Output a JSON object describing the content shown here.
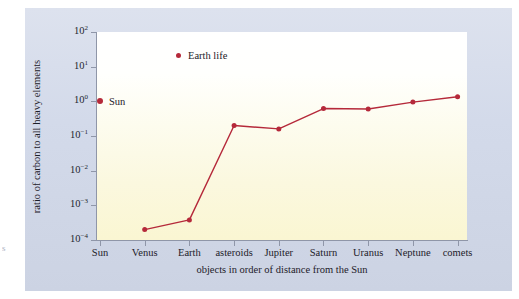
{
  "figure": {
    "margin_artifact": "s"
  },
  "chart_data": {
    "type": "line",
    "title": "",
    "subtitle": "",
    "xlabel": "objects in order of distance from the Sun",
    "ylabel": "ratio of carbon to all heavy elements",
    "yscale": "log",
    "ylim": [
      0.0001,
      100
    ],
    "grid": false,
    "legend_position": "top-center-inside",
    "categories": [
      "Sun",
      "Venus",
      "Earth",
      "asteroids",
      "Jupiter",
      "Saturn",
      "Uranus",
      "Neptune",
      "comets"
    ],
    "ytick_labels": [
      "10²",
      "10¹",
      "10⁰",
      "10⁻¹",
      "10⁻²",
      "10⁻³",
      "10⁻⁴"
    ],
    "ytick_bases": [
      "10",
      "10",
      "10",
      "10",
      "10",
      "10",
      "10"
    ],
    "ytick_exponents": [
      "2",
      "1",
      "0",
      "-1",
      "-2",
      "-3",
      "-4"
    ],
    "ytick_values": [
      100,
      10,
      1,
      0.1,
      0.01,
      0.001,
      0.0001
    ],
    "series": [
      {
        "name": "carbon to heavy element ratio",
        "color": "#b5293a",
        "x": [
          "Venus",
          "Earth",
          "asteroids",
          "Jupiter",
          "Saturn",
          "Uranus",
          "Neptune",
          "comets"
        ],
        "values": [
          0.0002,
          0.00038,
          0.2,
          0.16,
          0.62,
          0.6,
          0.95,
          1.35
        ]
      }
    ],
    "annotations": [
      {
        "name": "sun-marker",
        "label": "Sun",
        "x": "Sun",
        "value": 1.0,
        "color": "#b5293a"
      }
    ],
    "legend": [
      {
        "label": "Earth life",
        "color": "#b5293a",
        "marker": "dot"
      }
    ],
    "colors": {
      "series": "#b5293a",
      "panel": "#d3daea",
      "plot_top": "#ffffff",
      "plot_bottom": "#faf6d2",
      "axis": "#8f96a8",
      "text": "#1d2029"
    }
  }
}
